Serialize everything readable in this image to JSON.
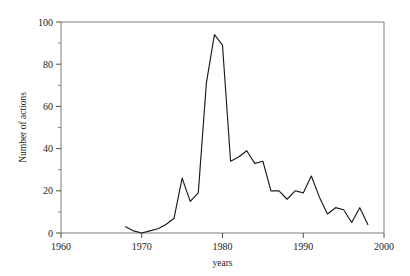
{
  "chart_data": {
    "type": "line",
    "title": "",
    "xlabel": "years",
    "ylabel": "Number of actions",
    "xlim": [
      1960,
      2000
    ],
    "ylim": [
      0,
      100
    ],
    "xticks": [
      1960,
      1970,
      1980,
      1990,
      2000
    ],
    "yticks": [
      0,
      20,
      40,
      60,
      80,
      100
    ],
    "xminor_step": 2,
    "yminor_step": 10,
    "grid": false,
    "legend": null,
    "series": [
      {
        "name": "Number of actions",
        "color": "#1a1a1a",
        "x": [
          1968,
          1969,
          1970,
          1971,
          1972,
          1973,
          1974,
          1975,
          1976,
          1977,
          1978,
          1979,
          1980,
          1981,
          1982,
          1983,
          1984,
          1985,
          1986,
          1987,
          1988,
          1989,
          1990,
          1991,
          1992,
          1993,
          1994,
          1995,
          1996,
          1997,
          1998
        ],
        "y": [
          3,
          1,
          0,
          1,
          2,
          4,
          7,
          26,
          15,
          19,
          71,
          94,
          89,
          34,
          36,
          39,
          33,
          34,
          20,
          20,
          16,
          20,
          19,
          27,
          17,
          9,
          12,
          11,
          5,
          12,
          4
        ]
      }
    ]
  },
  "labels": {
    "xtick_texts": [
      "1960",
      "1970",
      "1980",
      "1990",
      "2000"
    ],
    "ytick_texts": [
      "0",
      "20",
      "40",
      "60",
      "80",
      "100"
    ],
    "x_axis_title": "years",
    "y_axis_title": "Number of actions"
  }
}
